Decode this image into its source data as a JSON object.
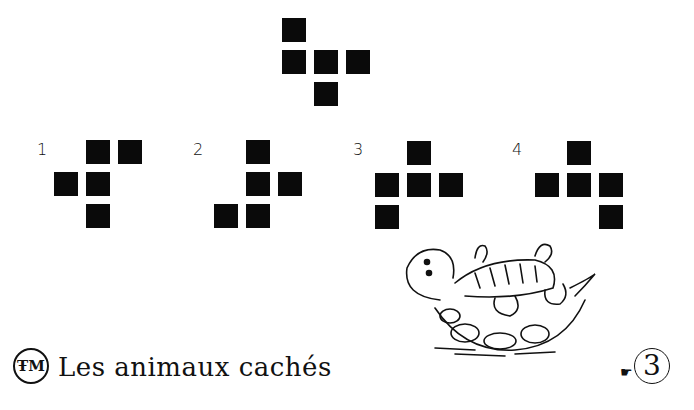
{
  "target_shape": {
    "cells": [
      [
        0,
        0
      ],
      [
        0,
        1
      ],
      [
        1,
        1
      ],
      [
        2,
        1
      ],
      [
        1,
        2
      ]
    ]
  },
  "options": [
    {
      "label": "1",
      "cells": [
        [
          1,
          0
        ],
        [
          2,
          0
        ],
        [
          0,
          1
        ],
        [
          1,
          1
        ],
        [
          1,
          2
        ]
      ]
    },
    {
      "label": "2",
      "cells": [
        [
          1,
          0
        ],
        [
          1,
          1
        ],
        [
          2,
          1
        ],
        [
          0,
          2
        ],
        [
          1,
          2
        ]
      ]
    },
    {
      "label": "3",
      "cells": [
        [
          1,
          0
        ],
        [
          0,
          1
        ],
        [
          1,
          1
        ],
        [
          2,
          1
        ],
        [
          0,
          2
        ]
      ]
    },
    {
      "label": "4",
      "cells": [
        [
          1,
          0
        ],
        [
          0,
          1
        ],
        [
          1,
          1
        ],
        [
          2,
          1
        ],
        [
          2,
          2
        ]
      ]
    }
  ],
  "footer": {
    "logo_text": "ŦM",
    "title": "Les animaux cachés",
    "page_number": "3",
    "pointer_icon": "pointing-hand-icon"
  },
  "illustration": {
    "subject": "turtle-on-back"
  },
  "colors": {
    "square": "#0a0a0a",
    "background": "#ffffff"
  }
}
